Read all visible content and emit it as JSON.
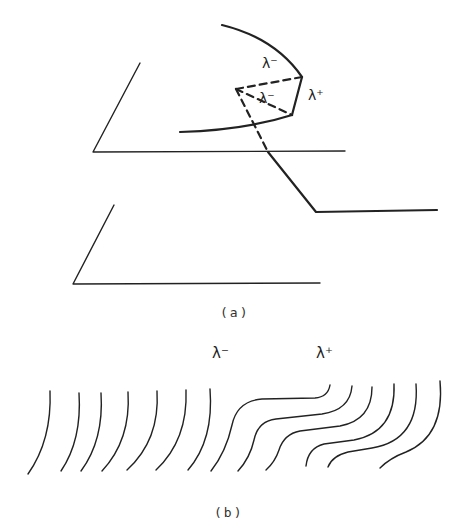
{
  "figure": {
    "panel_a": {
      "caption": "(a)",
      "labels": {
        "upper_minus": "λ⁻",
        "inner_minus": "λ⁻",
        "plus": "λ⁺"
      }
    },
    "panel_b": {
      "caption": "(b)",
      "labels": {
        "minus": "λ⁻",
        "plus": "λ⁺"
      }
    }
  },
  "colors": {
    "ink": "#222222",
    "background": "#ffffff"
  }
}
